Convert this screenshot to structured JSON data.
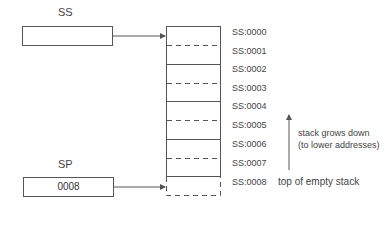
{
  "registers": {
    "ss": {
      "label": "SS",
      "value": ""
    },
    "sp": {
      "label": "SP",
      "value": "0008"
    }
  },
  "stack": {
    "addresses": [
      "SS:0000",
      "SS:0001",
      "SS:0002",
      "SS:0003",
      "SS:0004",
      "SS:0005",
      "SS:0006",
      "SS:0007",
      "SS:0008"
    ]
  },
  "annotations": {
    "growth_line1": "stack grows down",
    "growth_line2": "(to lower addresses)",
    "top_label": "top of empty stack"
  },
  "colors": {
    "line": "#555555",
    "text": "#444444"
  }
}
